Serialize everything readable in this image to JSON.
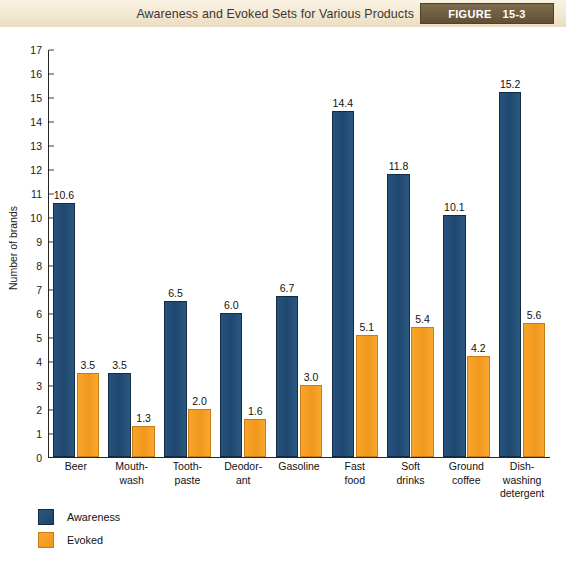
{
  "header": {
    "title": "Awareness and Evoked Sets for Various Products",
    "figure_word": "FIGURE",
    "figure_number": "15-3",
    "band_color": "#f3e8d2",
    "figure_box_color": "#6c5c3e"
  },
  "chart_data": {
    "type": "bar",
    "title": "Awareness and Evoked Sets for Various Products",
    "xlabel": "",
    "ylabel": "Number of brands",
    "ylim": [
      0,
      17
    ],
    "yticks": [
      0,
      1,
      2,
      3,
      4,
      5,
      6,
      7,
      8,
      9,
      10,
      11,
      12,
      13,
      14,
      15,
      16,
      17
    ],
    "ytick_labels": [
      "0",
      "1",
      "2",
      "3",
      "4",
      "5",
      "6",
      "7",
      "8",
      "9",
      "10",
      "11",
      "12",
      "13",
      "14",
      "15",
      "16",
      "17"
    ],
    "grid": false,
    "legend_position": "below-left",
    "categories": [
      "Beer",
      "Mouth-\nwash",
      "Tooth-\npaste",
      "Deodor-\nant",
      "Gasoline",
      "Fast\nfood",
      "Soft\ndrinks",
      "Ground\ncoffee",
      "Dish-\nwashing\ndetergent"
    ],
    "series": [
      {
        "name": "Awareness",
        "color": "#1f4871",
        "values": [
          10.6,
          3.5,
          6.5,
          6.0,
          6.7,
          14.4,
          11.8,
          10.1,
          15.2
        ],
        "labels": [
          "10.6",
          "3.5",
          "6.5",
          "6.0",
          "6.7",
          "14.4",
          "11.8",
          "10.1",
          "15.2"
        ]
      },
      {
        "name": "Evoked",
        "color": "#f2981c",
        "values": [
          3.5,
          1.3,
          2.0,
          1.6,
          3.0,
          5.1,
          5.4,
          4.2,
          5.6
        ],
        "labels": [
          "3.5",
          "1.3",
          "2.0",
          "1.6",
          "3.0",
          "5.1",
          "5.4",
          "4.2",
          "5.6"
        ]
      }
    ]
  },
  "legend": {
    "items": [
      {
        "label": "Awareness",
        "color": "#1f4871"
      },
      {
        "label": "Evoked",
        "color": "#f2981c"
      }
    ]
  }
}
